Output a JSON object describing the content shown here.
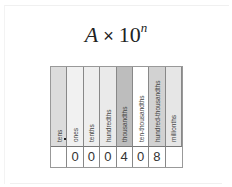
{
  "formula": {
    "base_var": "A",
    "times": "×",
    "ten": "10",
    "exponent": "n"
  },
  "place_value_chart": {
    "columns": [
      {
        "label": "tens",
        "color": "#dcdcdc",
        "value": ""
      },
      {
        "label": "ones",
        "color": "#f1f1f1",
        "value": "0"
      },
      {
        "label": "tenths",
        "color": "#eeeeee",
        "value": "0"
      },
      {
        "label": "hundredths",
        "color": "#eaeaea",
        "value": "0"
      },
      {
        "label": "thousandths",
        "color": "#bdbdbd",
        "value": "4"
      },
      {
        "label": "ten-thousandths",
        "color": "#ffffff",
        "value": "0"
      },
      {
        "label": "hundred-thousandths",
        "color": "#d2d2d2",
        "value": "8"
      },
      {
        "label": "millionths",
        "color": "#e6e6e6",
        "value": ""
      }
    ],
    "decimal_point": "."
  }
}
